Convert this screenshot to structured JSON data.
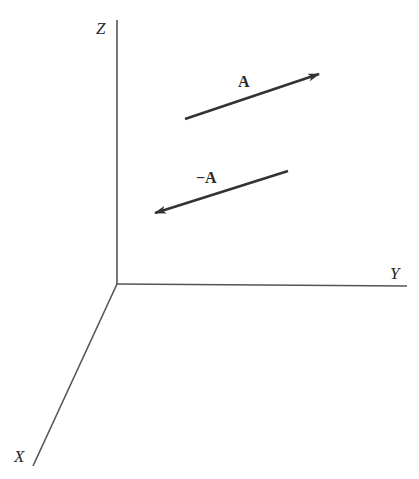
{
  "diagram": {
    "type": "3d-vector-axes",
    "axes": {
      "z": {
        "label": "Z"
      },
      "y": {
        "label": "Y"
      },
      "x": {
        "label": "X"
      }
    },
    "vectors": [
      {
        "name": "A",
        "label": "A"
      },
      {
        "name": "negative-A",
        "label": "−A"
      }
    ],
    "colors": {
      "line": "#333333",
      "text": "#2a2a2a"
    }
  }
}
